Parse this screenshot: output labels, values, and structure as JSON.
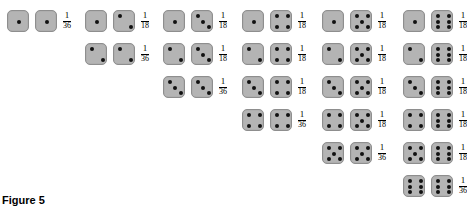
{
  "figure": {
    "caption": "Figure 5",
    "die_face_color": "#b4b4b4",
    "die_border_color": "#8e8e8e",
    "pip_color": "#111111",
    "background": "#ffffff"
  },
  "columns": [
    {
      "index": 1,
      "x": 7,
      "rows": [
        {
          "die_left": 1,
          "die_right": 1,
          "numerator": "1",
          "denominator": "36"
        }
      ]
    },
    {
      "index": 2,
      "x": 85,
      "rows": [
        {
          "die_left": 1,
          "die_right": 2,
          "numerator": "1",
          "denominator": "18"
        },
        {
          "die_left": 2,
          "die_right": 2,
          "numerator": "1",
          "denominator": "36"
        }
      ]
    },
    {
      "index": 3,
      "x": 163,
      "rows": [
        {
          "die_left": 1,
          "die_right": 3,
          "numerator": "1",
          "denominator": "18"
        },
        {
          "die_left": 2,
          "die_right": 3,
          "numerator": "1",
          "denominator": "18"
        },
        {
          "die_left": 3,
          "die_right": 3,
          "numerator": "1",
          "denominator": "36"
        }
      ]
    },
    {
      "index": 4,
      "x": 242,
      "rows": [
        {
          "die_left": 1,
          "die_right": 4,
          "numerator": "1",
          "denominator": "18"
        },
        {
          "die_left": 2,
          "die_right": 4,
          "numerator": "1",
          "denominator": "18"
        },
        {
          "die_left": 3,
          "die_right": 4,
          "numerator": "1",
          "denominator": "18"
        },
        {
          "die_left": 4,
          "die_right": 4,
          "numerator": "1",
          "denominator": "36"
        }
      ]
    },
    {
      "index": 5,
      "x": 322,
      "rows": [
        {
          "die_left": 1,
          "die_right": 5,
          "numerator": "1",
          "denominator": "18"
        },
        {
          "die_left": 2,
          "die_right": 5,
          "numerator": "1",
          "denominator": "18"
        },
        {
          "die_left": 3,
          "die_right": 5,
          "numerator": "1",
          "denominator": "18"
        },
        {
          "die_left": 4,
          "die_right": 5,
          "numerator": "1",
          "denominator": "18"
        },
        {
          "die_left": 5,
          "die_right": 5,
          "numerator": "1",
          "denominator": "36"
        }
      ]
    },
    {
      "index": 6,
      "x": 403,
      "rows": [
        {
          "die_left": 1,
          "die_right": 6,
          "numerator": "1",
          "denominator": "18"
        },
        {
          "die_left": 2,
          "die_right": 6,
          "numerator": "1",
          "denominator": "18"
        },
        {
          "die_left": 3,
          "die_right": 6,
          "numerator": "1",
          "denominator": "18"
        },
        {
          "die_left": 4,
          "die_right": 6,
          "numerator": "1",
          "denominator": "18"
        },
        {
          "die_left": 5,
          "die_right": 6,
          "numerator": "1",
          "denominator": "18"
        },
        {
          "die_left": 6,
          "die_right": 6,
          "numerator": "1",
          "denominator": "36"
        }
      ]
    }
  ],
  "layout": {
    "row_start_y": 9,
    "row_spacing": 33
  }
}
